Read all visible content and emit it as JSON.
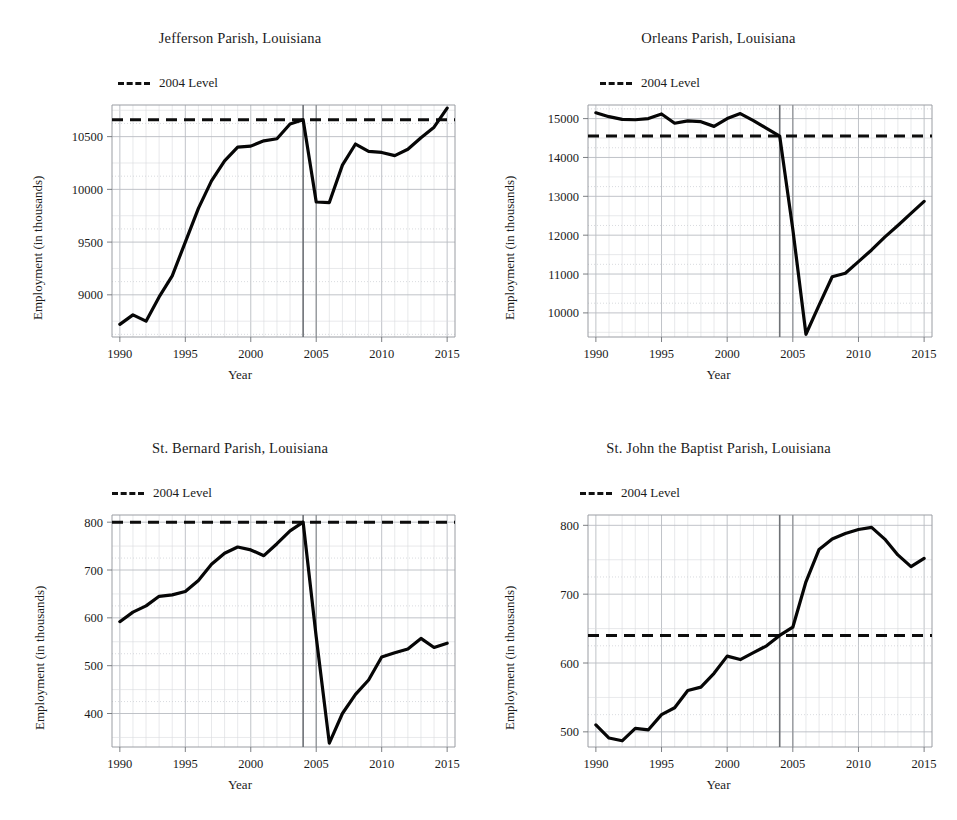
{
  "figure": {
    "layout": "2x2 small multiples",
    "background": "#ffffff",
    "series_color": "#060606",
    "reference_color": "#0d0d0d",
    "event_line_color": "#6f7276"
  },
  "common": {
    "xlabel": "Year",
    "ylabel": "Employment (in thousands)",
    "legend_label": "2004 Level",
    "x_ticks": [
      "1990",
      "1995",
      "2000",
      "2005",
      "2010",
      "2015"
    ],
    "x_tick_values": [
      1990,
      1995,
      2000,
      2005,
      2010,
      2015
    ],
    "xlim": [
      1989.4,
      2015.6
    ],
    "event_years": [
      2004,
      2005
    ]
  },
  "chart_data": [
    {
      "id": "jefferson",
      "type": "line",
      "title": "Jefferson Parish, Louisiana",
      "xlabel": "Year",
      "ylabel": "Employment (in thousands)",
      "legend": [
        "2004 Level"
      ],
      "legend_position": "above axes, left",
      "grid": true,
      "xlim": [
        1989.4,
        2015.6
      ],
      "ylim": [
        8600,
        10800
      ],
      "y_ticks": [
        9000,
        9500,
        10000,
        10500
      ],
      "y_tick_labels": [
        "9000",
        "9500",
        "10000",
        "10500"
      ],
      "reference_value": 10660,
      "x": [
        1990,
        1991,
        1992,
        1993,
        1994,
        1995,
        1996,
        1997,
        1998,
        1999,
        2000,
        2001,
        2002,
        2003,
        2004,
        2005,
        2006,
        2007,
        2008,
        2009,
        2010,
        2011,
        2012,
        2013,
        2014,
        2015
      ],
      "values": [
        8720,
        8810,
        8750,
        8980,
        9180,
        9500,
        9820,
        10080,
        10270,
        10400,
        10410,
        10460,
        10480,
        10620,
        10660,
        9880,
        9875,
        10230,
        10430,
        10360,
        10350,
        10320,
        10380,
        10490,
        10590,
        10770
      ]
    },
    {
      "id": "orleans",
      "type": "line",
      "title": "Orleans Parish, Louisiana",
      "xlabel": "Year",
      "ylabel": "Employment (in thousands)",
      "legend": [
        "2004 Level"
      ],
      "legend_position": "above axes, left",
      "grid": true,
      "xlim": [
        1989.4,
        2015.6
      ],
      "ylim": [
        9380,
        15350
      ],
      "y_ticks": [
        10000,
        11000,
        12000,
        13000,
        14000,
        15000
      ],
      "y_tick_labels": [
        "10000",
        "11000",
        "12000",
        "13000",
        "14000",
        "15000"
      ],
      "reference_value": 14550,
      "x": [
        1990,
        1991,
        1992,
        1993,
        1994,
        1995,
        1996,
        1997,
        1998,
        1999,
        2000,
        2001,
        2002,
        2003,
        2004,
        2005,
        2006,
        2007,
        2008,
        2009,
        2010,
        2011,
        2012,
        2013,
        2014,
        2015
      ],
      "values": [
        15150,
        15050,
        14980,
        14970,
        15000,
        15120,
        14880,
        14940,
        14920,
        14800,
        15000,
        15130,
        14950,
        14750,
        14550,
        12150,
        9450,
        10200,
        10930,
        11020,
        11320,
        11620,
        11950,
        12250,
        12560,
        12870
      ]
    },
    {
      "id": "st-bernard",
      "type": "line",
      "title": "St. Bernard Parish, Louisiana",
      "xlabel": "Year",
      "ylabel": "Employment (in thousands)",
      "legend": [
        "2004 Level"
      ],
      "legend_position": "above axes, left",
      "grid": true,
      "xlim": [
        1989.4,
        2015.6
      ],
      "ylim": [
        330,
        815
      ],
      "y_ticks": [
        400,
        500,
        600,
        700,
        800
      ],
      "y_tick_labels": [
        "400",
        "500",
        "600",
        "700",
        "800"
      ],
      "reference_value": 800,
      "x": [
        1990,
        1991,
        1992,
        1993,
        1994,
        1995,
        1996,
        1997,
        1998,
        1999,
        2000,
        2001,
        2002,
        2003,
        2004,
        2005,
        2006,
        2007,
        2008,
        2009,
        2010,
        2011,
        2012,
        2013,
        2014,
        2015
      ],
      "values": [
        592,
        612,
        625,
        645,
        648,
        655,
        678,
        712,
        735,
        748,
        742,
        730,
        755,
        782,
        800,
        560,
        338,
        400,
        440,
        470,
        518,
        527,
        535,
        557,
        538,
        547
      ]
    },
    {
      "id": "st-john-the-baptist",
      "type": "line",
      "title": "St. John the Baptist Parish, Louisiana",
      "xlabel": "Year",
      "ylabel": "Employment (in thousands)",
      "legend": [
        "2004 Level"
      ],
      "legend_position": "above axes, left",
      "grid": true,
      "xlim": [
        1989.4,
        2015.6
      ],
      "ylim": [
        478,
        815
      ],
      "y_ticks": [
        500,
        600,
        700,
        800
      ],
      "y_tick_labels": [
        "500",
        "600",
        "700",
        "800"
      ],
      "reference_value": 640,
      "x": [
        1990,
        1991,
        1992,
        1993,
        1994,
        1995,
        1996,
        1997,
        1998,
        1999,
        2000,
        2001,
        2002,
        2003,
        2004,
        2005,
        2006,
        2007,
        2008,
        2009,
        2010,
        2011,
        2012,
        2013,
        2014,
        2015
      ],
      "values": [
        510,
        491,
        487,
        505,
        503,
        525,
        535,
        560,
        565,
        585,
        610,
        605,
        615,
        625,
        640,
        652,
        718,
        765,
        780,
        788,
        794,
        797,
        780,
        757,
        740,
        752
      ]
    }
  ]
}
